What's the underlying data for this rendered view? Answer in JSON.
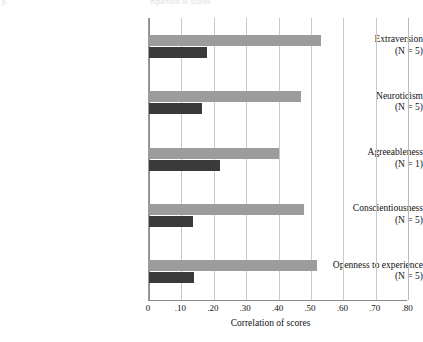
{
  "figure": {
    "clipped_header_left": "p.",
    "clipped_header_center": "mparison of scores",
    "clipped_header_right": ""
  },
  "axis": {
    "x_title": "Correlation of scores",
    "x_ticks": [
      "0",
      ".10",
      ".20",
      ".30",
      ".40",
      ".50",
      ".60",
      ".70",
      ".80"
    ],
    "x_tick_values": [
      0,
      0.1,
      0.2,
      0.3,
      0.4,
      0.5,
      0.6,
      0.7,
      0.8
    ]
  },
  "colors": {
    "series_light": "#9c9c9c",
    "series_dark": "#3a3a3a",
    "gridline": "#c9c9c9",
    "axis": "#8d8d8d",
    "background": "#ffffff"
  },
  "categories": [
    {
      "name": "Extraversion",
      "n_label": "(N = 5)"
    },
    {
      "name": "Neuroticism",
      "n_label": "(N = 5)"
    },
    {
      "name": "Agreeableness",
      "n_label": "(N = 1)"
    },
    {
      "name": "Conscientiousness",
      "n_label": "(N = 5)"
    },
    {
      "name": "Openness to experience",
      "n_label": "(N = 5)"
    }
  ],
  "chart_data": {
    "type": "bar",
    "orientation": "horizontal",
    "title": "",
    "xlabel": "Correlation of scores",
    "ylabel": "",
    "xlim": [
      0,
      0.8
    ],
    "xticks": [
      0,
      0.1,
      0.2,
      0.3,
      0.4,
      0.5,
      0.6,
      0.7,
      0.8
    ],
    "xticklabels": [
      "0",
      ".10",
      ".20",
      ".30",
      ".40",
      ".50",
      ".60",
      ".70",
      ".80"
    ],
    "grid": "vertical",
    "legend": "none",
    "categories": [
      "Extraversion (N = 5)",
      "Neuroticism (N = 5)",
      "Agreeableness (N = 1)",
      "Conscientiousness (N = 5)",
      "Openness to experience (N = 5)"
    ],
    "series": [
      {
        "name": "light-gray-bar",
        "color": "#9c9c9c",
        "values": [
          0.53,
          0.47,
          0.4,
          0.48,
          0.52
        ]
      },
      {
        "name": "dark-gray-bar",
        "color": "#3a3a3a",
        "values": [
          0.18,
          0.165,
          0.22,
          0.135,
          0.14
        ]
      }
    ]
  }
}
